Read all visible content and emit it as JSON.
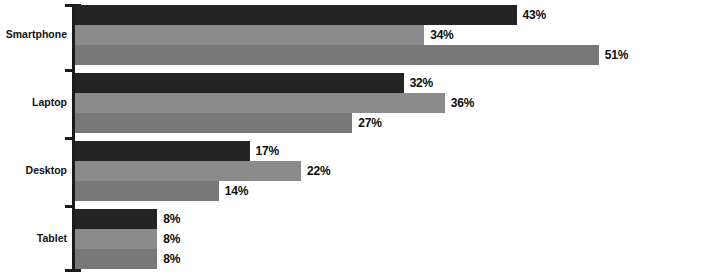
{
  "chart_data": {
    "type": "bar",
    "orientation": "horizontal",
    "title": "",
    "subtitle": "",
    "xlabel": "",
    "ylabel": "",
    "categories": [
      "Smartphone",
      "Laptop",
      "Desktop",
      "Tablet"
    ],
    "series": [
      {
        "name": "Series 1",
        "color": "#242424",
        "values": [
          43,
          32,
          17,
          8
        ]
      },
      {
        "name": "Series 2",
        "color": "#8b8b8b",
        "values": [
          34,
          36,
          22,
          8
        ]
      },
      {
        "name": "Series 3",
        "color": "#787878",
        "values": [
          27,
          27,
          14,
          8
        ]
      }
    ],
    "value_labels": [
      [
        "43%",
        "34%",
        "51%"
      ],
      [
        "32%",
        "36%",
        "27%"
      ],
      [
        "17%",
        "22%",
        "14%"
      ],
      [
        "8%",
        "8%",
        "8%"
      ]
    ],
    "value_suffix": "%",
    "xlim": [
      0,
      51
    ],
    "grid": false,
    "legend": "none",
    "axis_color": "#1b1b1b"
  },
  "groups": [
    {
      "category": "Smartphone",
      "bars": [
        {
          "label": "43%",
          "value": 43,
          "color": "#242424"
        },
        {
          "label": "34%",
          "value": 34,
          "color": "#8b8b8b"
        },
        {
          "label": "51%",
          "value": 51,
          "color": "#787878"
        }
      ]
    },
    {
      "category": "Laptop",
      "bars": [
        {
          "label": "32%",
          "value": 32,
          "color": "#242424"
        },
        {
          "label": "36%",
          "value": 36,
          "color": "#8b8b8b"
        },
        {
          "label": "27%",
          "value": 27,
          "color": "#787878"
        }
      ]
    },
    {
      "category": "Desktop",
      "bars": [
        {
          "label": "17%",
          "value": 17,
          "color": "#242424"
        },
        {
          "label": "22%",
          "value": 22,
          "color": "#8b8b8b"
        },
        {
          "label": "14%",
          "value": 14,
          "color": "#787878"
        }
      ]
    },
    {
      "category": "Tablet",
      "bars": [
        {
          "label": "8%",
          "value": 8,
          "color": "#242424"
        },
        {
          "label": "8%",
          "value": 8,
          "color": "#8b8b8b"
        },
        {
          "label": "8%",
          "value": 8,
          "color": "#787878"
        }
      ]
    }
  ],
  "layout": {
    "axis_x": 72,
    "bar_origin_x": 75,
    "px_per_unit": 10.27,
    "bar_height": 20,
    "group_tops": [
      5,
      73,
      141,
      209
    ],
    "tick_ys": [
      4,
      69,
      137,
      205,
      269
    ]
  }
}
